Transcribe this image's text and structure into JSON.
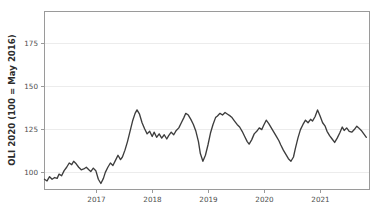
{
  "figure": {
    "width": 383,
    "height": 220,
    "background": "#ffffff"
  },
  "chart_data": {
    "type": "line",
    "title": "",
    "subtitle": "",
    "xlabel": "",
    "ylabel": "OLI 2020 (100 = May 2016)",
    "legend": [],
    "legend_position": "none",
    "grid": true,
    "grid_axis": "y",
    "line_color": "#3d3d3d",
    "line_width": 1.35,
    "xlim": [
      2016.42,
      2021.55
    ],
    "ylim": [
      93.0,
      197.0
    ],
    "xticks": [
      2017,
      2018,
      2019,
      2020,
      2021
    ],
    "xtick_labels": [
      "2017",
      "2018",
      "2019",
      "2020",
      "2021"
    ],
    "yticks": [
      100,
      125,
      150,
      175
    ],
    "ytick_labels": [
      "100",
      "125",
      "150",
      "175"
    ],
    "series": [
      {
        "name": "OLI 2020",
        "x": [
          2016.42,
          2016.46,
          2016.5,
          2016.54,
          2016.58,
          2016.62,
          2016.65,
          2016.69,
          2016.73,
          2016.77,
          2016.81,
          2016.85,
          2016.88,
          2016.92,
          2016.96,
          2017.0,
          2017.04,
          2017.08,
          2017.12,
          2017.15,
          2017.19,
          2017.23,
          2017.27,
          2017.31,
          2017.35,
          2017.38,
          2017.42,
          2017.46,
          2017.5,
          2017.54,
          2017.58,
          2017.62,
          2017.65,
          2017.69,
          2017.73,
          2017.77,
          2017.81,
          2017.85,
          2017.88,
          2017.92,
          2017.96,
          2018.0,
          2018.04,
          2018.08,
          2018.12,
          2018.15,
          2018.19,
          2018.23,
          2018.27,
          2018.31,
          2018.35,
          2018.38,
          2018.42,
          2018.46,
          2018.5,
          2018.54,
          2018.58,
          2018.62,
          2018.65,
          2018.69,
          2018.73,
          2018.77,
          2018.81,
          2018.85,
          2018.88,
          2018.92,
          2018.96,
          2019.0,
          2019.04,
          2019.08,
          2019.12,
          2019.15,
          2019.19,
          2019.23,
          2019.27,
          2019.31,
          2019.35,
          2019.38,
          2019.42,
          2019.46,
          2019.5,
          2019.54,
          2019.58,
          2019.62,
          2019.65,
          2019.69,
          2019.73,
          2019.77,
          2019.81,
          2019.85,
          2019.88,
          2019.92,
          2019.96,
          2020.0,
          2020.04,
          2020.08,
          2020.12,
          2020.15,
          2020.19,
          2020.23,
          2020.27,
          2020.31,
          2020.35,
          2020.38,
          2020.42,
          2020.46,
          2020.5,
          2020.54,
          2020.58,
          2020.62,
          2020.65,
          2020.69,
          2020.73,
          2020.77,
          2020.81,
          2020.85,
          2020.88,
          2020.92,
          2020.96,
          2021.0,
          2021.04,
          2021.08,
          2021.12,
          2021.15,
          2021.19,
          2021.23,
          2021.27,
          2021.31,
          2021.35,
          2021.38,
          2021.42,
          2021.46,
          2021.5
        ],
        "values": [
          99.0,
          98.0,
          100.5,
          99.0,
          100.0,
          99.5,
          102.0,
          101.0,
          104.0,
          106.0,
          108.5,
          107.5,
          109.5,
          108.0,
          106.0,
          104.5,
          105.0,
          106.0,
          104.5,
          103.5,
          105.5,
          104.0,
          99.0,
          96.5,
          99.5,
          103.0,
          106.0,
          108.5,
          107.0,
          110.0,
          113.0,
          110.5,
          112.0,
          116.0,
          121.0,
          127.0,
          133.0,
          137.5,
          139.5,
          137.0,
          132.0,
          128.5,
          125.5,
          127.0,
          124.0,
          126.5,
          123.5,
          125.5,
          123.0,
          125.0,
          122.5,
          124.5,
          126.5,
          125.0,
          127.5,
          129.0,
          132.0,
          135.0,
          137.5,
          136.5,
          134.0,
          131.0,
          127.0,
          121.0,
          114.0,
          109.5,
          113.0,
          119.0,
          126.0,
          131.0,
          135.0,
          136.0,
          137.5,
          136.5,
          138.0,
          137.0,
          136.0,
          135.0,
          133.0,
          131.0,
          129.5,
          127.0,
          124.0,
          121.0,
          119.5,
          122.0,
          125.5,
          127.0,
          129.0,
          128.0,
          130.5,
          133.5,
          131.5,
          129.0,
          126.5,
          124.0,
          121.5,
          119.0,
          116.0,
          113.5,
          111.0,
          109.5,
          112.0,
          117.0,
          123.0,
          128.0,
          131.0,
          133.5,
          132.0,
          134.0,
          133.0,
          135.5,
          139.5,
          136.0,
          132.0,
          130.0,
          127.0,
          124.5,
          122.5,
          120.5,
          123.0,
          126.0,
          129.5,
          127.5,
          129.0,
          127.0,
          126.5,
          128.0,
          130.0,
          129.0,
          127.5,
          125.5,
          123.5
        ]
      }
    ],
    "annotations": [],
    "notes": {
      "y_axis_unit": "index",
      "baseline": "100 = May 2016",
      "series_max_approx": 193,
      "series_min_approx": 96
    }
  },
  "axes": {
    "y_title": "OLI 2020 (100 = May 2016)",
    "x_tick_labels": [
      "2017",
      "2018",
      "2019",
      "2020",
      "2021"
    ],
    "y_tick_labels": [
      "100",
      "125",
      "150",
      "175"
    ]
  }
}
